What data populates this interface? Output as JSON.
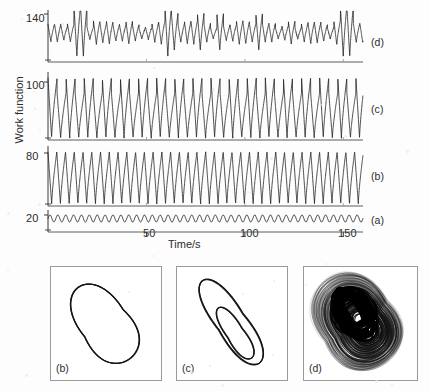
{
  "figure": {
    "ylabel": "Work function",
    "xlabel": "Time/s",
    "background_color": "#fdfdfd",
    "line_color": "#1f1f1f",
    "box_border_color": "#9a9a9a"
  },
  "chart_data": {
    "type": "line",
    "title": "",
    "xlabel": "Time/s",
    "ylabel": "Work function",
    "xlim": [
      0,
      160
    ],
    "xticks": [
      50,
      100,
      150
    ],
    "xtick_labels": [
      "50",
      "100",
      "150"
    ],
    "grid": false,
    "legend_position": "right-of-axes",
    "panels": [
      {
        "label": "(a)",
        "ytick_labels": [
          "20"
        ],
        "ytick_values": [
          20
        ],
        "regime": "small-amplitude periodic",
        "waveform": "sine",
        "period_s": 4.0,
        "amplitude": 3.2,
        "baseline": 20,
        "n_cycles": 40
      },
      {
        "label": "(b)",
        "ytick_labels": [
          "80"
        ],
        "ytick_values": [
          80
        ],
        "regime": "period-1 relaxation oscillation",
        "waveform": "relaxation",
        "period_s": 4.45,
        "amplitude": 40,
        "baseline": 80,
        "n_cycles": 36
      },
      {
        "label": "(c)",
        "ytick_labels": [
          "100"
        ],
        "ytick_values": [
          100
        ],
        "regime": "period-2 oscillation",
        "waveform": "relaxation-period-2",
        "period_s": 4.6,
        "amplitude": 44,
        "amplitude_alternation": 0.16,
        "baseline": 100,
        "n_cycles": 35
      },
      {
        "label": "(d)",
        "ytick_labels": [
          "140"
        ],
        "ytick_values": [
          140
        ],
        "regime": "chaotic",
        "waveform": "chaotic",
        "period_s": 3.3,
        "amplitude": 13,
        "baseline": 140,
        "n_cycles": 48,
        "deep_spike_times": [
          14,
          62,
          150
        ]
      }
    ]
  },
  "attractors": [
    {
      "label": "(b)",
      "type": "phase-portrait",
      "description": "single closed limit cycle, tilted leaf shape",
      "loops": 1,
      "density": "thin"
    },
    {
      "label": "(c)",
      "type": "phase-portrait",
      "description": "period-2 orbit, narrow outer loop with nested inner loop",
      "loops": 2,
      "density": "thin"
    },
    {
      "label": "(d)",
      "type": "phase-portrait",
      "description": "chaotic attractor, dense banded filled region",
      "loops": 120,
      "density": "dense"
    }
  ]
}
